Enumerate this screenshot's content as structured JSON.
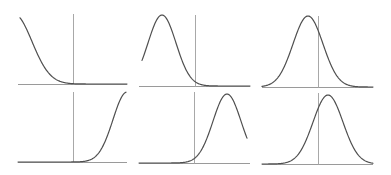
{
  "chart_data": [
    {
      "type": "line",
      "title": "",
      "panel": "top-left",
      "description": "Right tail of a normal curve descending to baseline, vertical marker to the right of the curve",
      "axis": {
        "x1": 18,
        "x2": 127,
        "y": 84
      },
      "marker_x": 73,
      "marker_top": 14,
      "curve": {
        "mean_px": 14,
        "sd_px": 18,
        "peak_y": 14,
        "x_start": 20,
        "x_end": 127
      },
      "xlabel": "",
      "ylabel": "",
      "grid": false
    },
    {
      "type": "line",
      "title": "",
      "panel": "top-middle",
      "description": "Bell curve shifted left, vertical marker on right tail",
      "axis": {
        "x1": 139,
        "x2": 250,
        "y": 86
      },
      "marker_x": 195,
      "marker_top": 15,
      "curve": {
        "mean_px": 162,
        "sd_px": 14,
        "peak_y": 15,
        "x_start": 142,
        "x_end": 250
      },
      "xlabel": "",
      "ylabel": "",
      "grid": false
    },
    {
      "type": "line",
      "title": "",
      "panel": "top-right",
      "description": "Full bell curve, vertical marker slightly right of peak",
      "axis": {
        "x1": 262,
        "x2": 373,
        "y": 87
      },
      "marker_x": 318,
      "marker_top": 16,
      "curve": {
        "mean_px": 308,
        "sd_px": 15,
        "peak_y": 16,
        "x_start": 262,
        "x_end": 373
      },
      "xlabel": "",
      "ylabel": "",
      "grid": false
    },
    {
      "type": "line",
      "title": "",
      "panel": "bottom-left",
      "description": "Left tail of a normal curve rising to the right, vertical marker at start of rise",
      "axis": {
        "x1": 18,
        "x2": 127,
        "y": 162
      },
      "marker_x": 73,
      "marker_top": 92,
      "curve": {
        "mean_px": 127,
        "sd_px": 14,
        "peak_y": 92,
        "x_start": 18,
        "x_end": 126
      },
      "xlabel": "",
      "ylabel": "",
      "grid": false
    },
    {
      "type": "line",
      "title": "",
      "panel": "bottom-middle",
      "description": "Bell curve shifted right, vertical marker on left tail",
      "axis": {
        "x1": 139,
        "x2": 250,
        "y": 163
      },
      "marker_x": 194,
      "marker_top": 92,
      "curve": {
        "mean_px": 227,
        "sd_px": 14,
        "peak_y": 94,
        "x_start": 139,
        "x_end": 247
      },
      "xlabel": "",
      "ylabel": "",
      "grid": false
    },
    {
      "type": "line",
      "title": "",
      "panel": "bottom-right",
      "description": "Full bell curve, vertical marker slightly left of peak",
      "axis": {
        "x1": 262,
        "x2": 373,
        "y": 164
      },
      "marker_x": 318,
      "marker_top": 93,
      "curve": {
        "mean_px": 328,
        "sd_px": 15,
        "peak_y": 95,
        "x_start": 262,
        "x_end": 373
      },
      "xlabel": "",
      "ylabel": "",
      "grid": false
    }
  ],
  "colors": {
    "background": "#ffffff",
    "curve": "#4f4f4f",
    "axis": "#9a9a9a",
    "marker": "#a8a8a8"
  }
}
